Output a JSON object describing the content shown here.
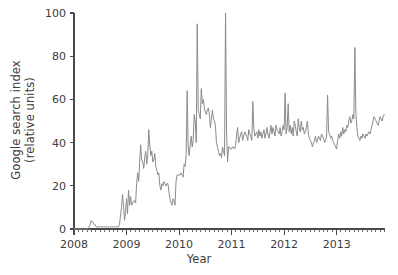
{
  "chart_data": {
    "type": "line",
    "title": "",
    "xlabel": "Year",
    "ylabel": "Google search index (relative units)",
    "ylabel_line1": "Google search index",
    "ylabel_line2": "(relative units)",
    "xlim": [
      2008.0,
      2013.92
    ],
    "ylim": [
      0,
      100
    ],
    "yticks": [
      0,
      20,
      40,
      60,
      80,
      100
    ],
    "ytick_labels": [
      "0",
      "20",
      "40",
      "60",
      "80",
      "100"
    ],
    "xticks": [
      2008,
      2009,
      2010,
      2011,
      2012,
      2013
    ],
    "xtick_labels": [
      "2008",
      "2009",
      "2010",
      "2011",
      "2012",
      "2013"
    ],
    "x_minor_tick_interval": 0.0833,
    "grid": false,
    "legend": null,
    "series_name": "Google search index",
    "line_color": "#8b8b8b",
    "axis_color": "#4a4a4a",
    "text_color": "#3c3c3c",
    "x": [
      2008.0,
      2008.019,
      2008.038,
      2008.058,
      2008.077,
      2008.096,
      2008.115,
      2008.135,
      2008.154,
      2008.173,
      2008.192,
      2008.212,
      2008.231,
      2008.25,
      2008.269,
      2008.288,
      2008.308,
      2008.327,
      2008.346,
      2008.365,
      2008.385,
      2008.404,
      2008.423,
      2008.442,
      2008.462,
      2008.481,
      2008.5,
      2008.519,
      2008.538,
      2008.558,
      2008.577,
      2008.596,
      2008.615,
      2008.635,
      2008.654,
      2008.673,
      2008.692,
      2008.712,
      2008.731,
      2008.75,
      2008.769,
      2008.788,
      2008.808,
      2008.827,
      2008.846,
      2008.865,
      2008.885,
      2008.904,
      2008.923,
      2008.942,
      2008.962,
      2008.981,
      2009.0,
      2009.019,
      2009.038,
      2009.058,
      2009.077,
      2009.096,
      2009.115,
      2009.135,
      2009.154,
      2009.173,
      2009.192,
      2009.212,
      2009.231,
      2009.25,
      2009.269,
      2009.288,
      2009.308,
      2009.327,
      2009.346,
      2009.365,
      2009.385,
      2009.404,
      2009.423,
      2009.442,
      2009.462,
      2009.481,
      2009.5,
      2009.519,
      2009.538,
      2009.558,
      2009.577,
      2009.596,
      2009.615,
      2009.635,
      2009.654,
      2009.673,
      2009.692,
      2009.712,
      2009.731,
      2009.75,
      2009.769,
      2009.788,
      2009.808,
      2009.827,
      2009.846,
      2009.865,
      2009.885,
      2009.904,
      2009.923,
      2009.942,
      2009.962,
      2009.981,
      2010.0,
      2010.019,
      2010.038,
      2010.058,
      2010.077,
      2010.096,
      2010.115,
      2010.135,
      2010.154,
      2010.173,
      2010.192,
      2010.212,
      2010.231,
      2010.25,
      2010.269,
      2010.288,
      2010.308,
      2010.327,
      2010.346,
      2010.365,
      2010.385,
      2010.404,
      2010.423,
      2010.442,
      2010.462,
      2010.481,
      2010.5,
      2010.519,
      2010.538,
      2010.558,
      2010.577,
      2010.596,
      2010.615,
      2010.635,
      2010.654,
      2010.673,
      2010.692,
      2010.712,
      2010.731,
      2010.75,
      2010.769,
      2010.788,
      2010.808,
      2010.827,
      2010.846,
      2010.865,
      2010.885,
      2010.904,
      2010.923,
      2010.942,
      2010.962,
      2010.981,
      2011.0,
      2011.019,
      2011.038,
      2011.058,
      2011.077,
      2011.096,
      2011.115,
      2011.135,
      2011.154,
      2011.173,
      2011.192,
      2011.212,
      2011.231,
      2011.25,
      2011.269,
      2011.288,
      2011.308,
      2011.327,
      2011.346,
      2011.365,
      2011.385,
      2011.404,
      2011.423,
      2011.442,
      2011.462,
      2011.481,
      2011.5,
      2011.519,
      2011.538,
      2011.558,
      2011.577,
      2011.596,
      2011.615,
      2011.635,
      2011.654,
      2011.673,
      2011.692,
      2011.712,
      2011.731,
      2011.75,
      2011.769,
      2011.788,
      2011.808,
      2011.827,
      2011.846,
      2011.865,
      2011.885,
      2011.904,
      2011.923,
      2011.942,
      2011.962,
      2011.981,
      2012.0,
      2012.019,
      2012.038,
      2012.058,
      2012.077,
      2012.096,
      2012.115,
      2012.135,
      2012.154,
      2012.173,
      2012.192,
      2012.212,
      2012.231,
      2012.25,
      2012.269,
      2012.288,
      2012.308,
      2012.327,
      2012.346,
      2012.365,
      2012.385,
      2012.404,
      2012.423,
      2012.442,
      2012.462,
      2012.481,
      2012.5,
      2012.519,
      2012.538,
      2012.558,
      2012.577,
      2012.596,
      2012.615,
      2012.635,
      2012.654,
      2012.673,
      2012.692,
      2012.712,
      2012.731,
      2012.75,
      2012.769,
      2012.788,
      2012.808,
      2012.827,
      2012.846,
      2012.865,
      2012.885,
      2012.904,
      2012.923,
      2012.942,
      2012.962,
      2012.981,
      2013.0,
      2013.019,
      2013.038,
      2013.058,
      2013.077,
      2013.096,
      2013.115,
      2013.135,
      2013.154,
      2013.173,
      2013.192,
      2013.212,
      2013.231,
      2013.25,
      2013.269,
      2013.288,
      2013.308,
      2013.327,
      2013.346,
      2013.365,
      2013.385,
      2013.404,
      2013.423,
      2013.442,
      2013.462,
      2013.481,
      2013.5,
      2013.519,
      2013.538,
      2013.558,
      2013.577,
      2013.596,
      2013.615,
      2013.635,
      2013.654,
      2013.673,
      2013.692,
      2013.712,
      2013.731,
      2013.75,
      2013.769,
      2013.788,
      2013.808,
      2013.827,
      2013.846,
      2013.865,
      2013.885,
      2013.904
    ],
    "y": [
      0,
      0,
      0,
      0,
      0,
      0,
      0,
      0,
      0,
      0,
      0,
      0,
      0,
      0,
      0,
      1,
      2,
      4,
      3,
      3,
      2,
      2,
      1,
      1,
      1,
      1,
      1,
      1,
      1,
      1,
      1,
      1,
      1,
      1,
      1,
      1,
      1,
      1,
      1,
      1,
      1,
      1,
      1,
      1,
      1,
      2,
      6,
      10,
      16,
      11,
      4,
      8,
      14,
      7,
      18,
      11,
      15,
      11,
      12,
      13,
      13,
      12,
      21,
      26,
      22,
      31,
      39,
      32,
      31,
      28,
      33,
      36,
      30,
      34,
      46,
      39,
      34,
      36,
      31,
      32,
      35,
      29,
      27,
      25,
      26,
      20,
      18,
      21,
      20,
      22,
      21,
      20,
      21,
      21,
      17,
      14,
      12,
      11,
      14,
      13,
      11,
      22,
      25,
      25,
      25,
      25,
      26,
      25,
      24,
      30,
      29,
      34,
      64,
      38,
      34,
      39,
      43,
      38,
      41,
      53,
      50,
      40,
      95,
      55,
      53,
      51,
      65,
      58,
      60,
      56,
      54,
      53,
      55,
      56,
      53,
      47,
      51,
      55,
      51,
      50,
      48,
      40,
      38,
      36,
      34,
      35,
      33,
      38,
      36,
      34,
      100,
      45,
      31,
      38,
      38,
      37,
      37,
      38,
      38,
      37,
      39,
      44,
      47,
      40,
      42,
      44,
      45,
      41,
      43,
      45,
      44,
      43,
      41,
      46,
      44,
      43,
      41,
      59,
      47,
      43,
      44,
      45,
      42,
      46,
      43,
      45,
      42,
      44,
      46,
      42,
      44,
      47,
      44,
      42,
      45,
      48,
      44,
      47,
      45,
      43,
      48,
      46,
      45,
      44,
      47,
      43,
      45,
      48,
      46,
      63,
      44,
      47,
      58,
      45,
      48,
      44,
      47,
      43,
      50,
      48,
      45,
      43,
      51,
      47,
      45,
      50,
      46,
      47,
      44,
      45,
      47,
      50,
      44,
      42,
      41,
      40,
      38,
      40,
      41,
      43,
      40,
      41,
      43,
      42,
      41,
      44,
      43,
      42,
      40,
      41,
      43,
      62,
      45,
      44,
      42,
      43,
      41,
      40,
      39,
      38,
      37,
      41,
      44,
      42,
      45,
      43,
      47,
      44,
      46,
      45,
      48,
      47,
      50,
      52,
      49,
      50,
      53,
      51,
      84,
      54,
      47,
      43,
      42,
      41,
      43,
      42,
      44,
      43,
      42,
      44,
      43,
      44,
      45,
      44,
      46,
      48,
      50,
      52,
      51,
      50,
      49,
      48,
      50,
      52,
      51,
      50,
      52,
      53
    ]
  },
  "figure": {
    "background": "#ffffff",
    "plot_left": 74,
    "plot_right": 385,
    "plot_top": 13,
    "plot_bottom": 229
  }
}
